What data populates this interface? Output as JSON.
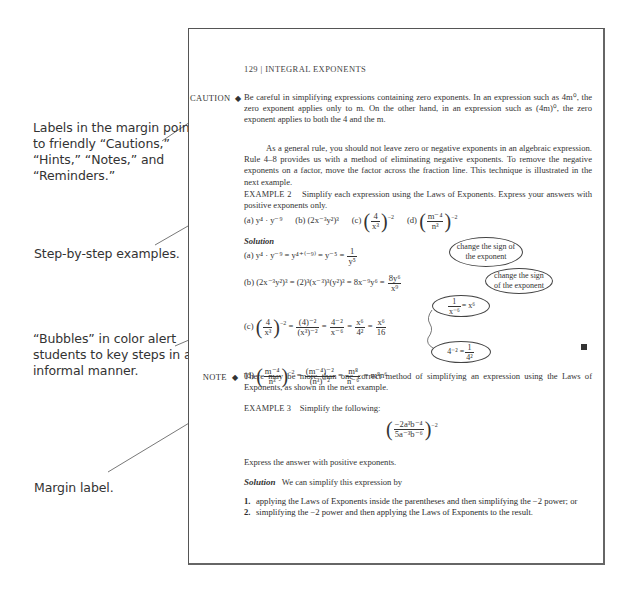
{
  "annotations": [
    {
      "id": "labels",
      "lines": [
        "Labels in the margin point",
        "to friendly “Cautions,”",
        "“Hints,” “Notes,” and",
        "“Reminders.”"
      ]
    },
    {
      "id": "examples",
      "lines": [
        "Step-by-step examples."
      ]
    },
    {
      "id": "bubbles",
      "lines": [
        "“Bubbles” in color alert",
        "students to key steps in an",
        "informal manner."
      ]
    },
    {
      "id": "margin",
      "lines": [
        "Margin label."
      ]
    }
  ],
  "page": {
    "header": {
      "page_number": "129",
      "separator": "|",
      "title": "INTEGRAL EXPONENTS"
    },
    "caution": {
      "label": "CAUTION",
      "marker": "◆",
      "paragraph": "Be careful in simplifying expressions containing zero exponents. In an expression such as 4m⁰, the zero exponent applies only to m. On the other hand, in an expression such as (4m)⁰, the zero exponent applies to both the 4 and the m."
    },
    "general_rule": "As a general rule, you should not leave zero or negative exponents in an algebraic expression. Rule 4–8 provides us with a method of eliminating negative exponents. To remove the negative exponents on a factor, move the factor across the fraction line. This technique is illustrated in the next example.",
    "example2": {
      "title": "EXAMPLE 2",
      "prompt": "Simplify each expression using the Laws of Exponents. Express your answers with positive exponents only.",
      "problems": {
        "a": "(a) y⁴ · y⁻⁹",
        "b": "(b) (2x⁻³y²)³",
        "c_label": "(c)",
        "c_num": "4",
        "c_den": "x³",
        "c_exp": "−2",
        "d_label": "(d)",
        "d_num": "m⁻⁴",
        "d_den": "n³",
        "d_exp": "−2"
      },
      "solution_label": "Solution",
      "solutions": {
        "a_lhs": "(a) y⁴ · y⁻⁹ = y⁴⁺⁽⁻⁹⁾ = y⁻⁵ =",
        "a_num": "1",
        "a_den": "y⁵",
        "b_lhs": "(b) (2x⁻³y²)³ = (2)³(x⁻³)³(y²)³ = 8x⁻⁹y⁶ =",
        "b_num": "8y⁶",
        "b_den": "x⁹",
        "c_label": "(c)",
        "c_frac1_num": "4",
        "c_frac1_den": "x³",
        "c_exp": "−2",
        "c_frac2_num": "(4)⁻²",
        "c_frac2_den": "(x³)⁻²",
        "c_frac3_num": "4⁻²",
        "c_frac3_den": "x⁻⁶",
        "c_frac4_num": "x⁶",
        "c_frac4_den": "4²",
        "c_frac5_num": "x⁶",
        "c_frac5_den": "16",
        "d_label": "(d)",
        "d_frac1_num": "m⁻⁴",
        "d_frac1_den": "n³",
        "d_exp": "−2",
        "d_frac2_num": "(m⁻⁴)⁻²",
        "d_frac2_den": "(n³)⁻²",
        "d_frac3_num": "m⁸",
        "d_frac3_den": "n⁻⁶",
        "d_result": "= m⁸n⁶",
        "equals": "="
      },
      "bubbles": {
        "a": [
          "change the sign of",
          "the exponent"
        ],
        "b": [
          "change the sign",
          "of the exponent"
        ],
        "c_top_num": "1",
        "c_top_den": "x⁻⁶",
        "c_top_rhs": "= x⁶",
        "c_bottom_lhs": "4⁻² =",
        "c_bottom_num": "1",
        "c_bottom_den": "4²"
      }
    },
    "note": {
      "label": "NOTE",
      "marker": "◆",
      "paragraph": "There may be more than one correct method of simplifying an expression using the Laws of Exponents, as shown in the next example."
    },
    "example3": {
      "title": "EXAMPLE 3",
      "prompt": "Simplify the following:",
      "expr_num": "−2a³b⁻⁴",
      "expr_den": "5a⁻³b⁻⁶",
      "expr_exp": "−2",
      "instruction": "Express the answer with positive exponents.",
      "solution_label": "Solution",
      "solution_intro": "We can simplify this expression by",
      "steps": [
        {
          "n": "1.",
          "text": "applying the Laws of Exponents inside the parentheses and then simplifying the −2 power; or"
        },
        {
          "n": "2.",
          "text": "simplifying the −2 power and then applying the Laws of Exponents to the result."
        }
      ]
    }
  },
  "colors": {
    "text": "#333333",
    "border": "#555555",
    "background": "#ffffff"
  }
}
